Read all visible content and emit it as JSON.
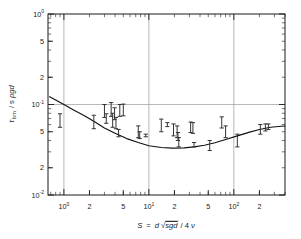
{
  "figure": {
    "background": "#ffffff",
    "ink": "#1a1a1a",
    "grid_color": "#9a9a9a",
    "curve_color": "#111111",
    "marker_color": "#333333"
  },
  "axes": {
    "x": {
      "title_parts": {
        "sym": "S",
        "eq": "=",
        "d": "d",
        "radicand": "sgd",
        "slash": "/ 4",
        "nu": "ν"
      },
      "title_plain": "S = d √sgd / 4 ν",
      "scale": "log",
      "min": 0.65,
      "max": 400,
      "tick_labels": [
        {
          "value": 1,
          "text": "10",
          "sup": "0"
        },
        {
          "value": 2,
          "text": "2",
          "sup": ""
        },
        {
          "value": 5,
          "text": "5",
          "sup": ""
        },
        {
          "value": 10,
          "text": "10",
          "sup": "1"
        },
        {
          "value": 20,
          "text": "2",
          "sup": ""
        },
        {
          "value": 50,
          "text": "5",
          "sup": ""
        },
        {
          "value": 100,
          "text": "10",
          "sup": "2"
        },
        {
          "value": 200,
          "text": "2",
          "sup": ""
        }
      ],
      "gridlines": [
        1,
        10,
        100
      ]
    },
    "y": {
      "title_parts": {
        "tau": "τ",
        "sub": "bm",
        "slash": "/ s",
        "rho": "ρ",
        "gd": "gd"
      },
      "title_plain": "τ bm / s ρgd",
      "scale": "log",
      "min": 0.01,
      "max": 1.0,
      "tick_labels": [
        {
          "value": 1.0,
          "text": "10",
          "sup": "0"
        },
        {
          "value": 0.5,
          "text": "5",
          "sup": ""
        },
        {
          "value": 0.2,
          "text": "2",
          "sup": ""
        },
        {
          "value": 0.1,
          "text": "10",
          "sup": "-1"
        },
        {
          "value": 0.05,
          "text": "5",
          "sup": ""
        },
        {
          "value": 0.02,
          "text": "2",
          "sup": ""
        },
        {
          "value": 0.01,
          "text": "10",
          "sup": "-2"
        }
      ],
      "gridlines": [
        0.1
      ]
    }
  },
  "chart_data": {
    "type": "scatter",
    "title": "",
    "subtitle": "",
    "xlabel": "S = d √sgd / 4 ν",
    "ylabel": "τ bm / s ρgd",
    "xscale": "log",
    "yscale": "log",
    "xlim": [
      0.65,
      400
    ],
    "ylim": [
      0.01,
      1.0
    ],
    "grid": true,
    "legend": "none",
    "series": [
      {
        "name": "measured bed shear stress",
        "type": "errorbar",
        "points": [
          {
            "x": 0.9,
            "y": 0.067,
            "ylow": 0.056,
            "yhigh": 0.079
          },
          {
            "x": 2.25,
            "y": 0.064,
            "ylow": 0.054,
            "yhigh": 0.076
          },
          {
            "x": 3.0,
            "y": 0.085,
            "ylow": 0.072,
            "yhigh": 0.1
          },
          {
            "x": 3.15,
            "y": 0.07,
            "ylow": 0.062,
            "yhigh": 0.079
          },
          {
            "x": 3.6,
            "y": 0.09,
            "ylow": 0.074,
            "yhigh": 0.105
          },
          {
            "x": 3.75,
            "y": 0.066,
            "ylow": 0.056,
            "yhigh": 0.08
          },
          {
            "x": 3.95,
            "y": 0.08,
            "ylow": 0.068,
            "yhigh": 0.092
          },
          {
            "x": 4.1,
            "y": 0.062,
            "ylow": 0.054,
            "yhigh": 0.072
          },
          {
            "x": 4.4,
            "y": 0.048,
            "ylow": 0.044,
            "yhigh": 0.053
          },
          {
            "x": 4.55,
            "y": 0.086,
            "ylow": 0.074,
            "yhigh": 0.1
          },
          {
            "x": 5.0,
            "y": 0.087,
            "ylow": 0.075,
            "yhigh": 0.101
          },
          {
            "x": 7.5,
            "y": 0.05,
            "ylow": 0.043,
            "yhigh": 0.058
          },
          {
            "x": 7.8,
            "y": 0.046,
            "ylow": 0.042,
            "yhigh": 0.05
          },
          {
            "x": 9.2,
            "y": 0.045,
            "ylow": 0.044,
            "yhigh": 0.047
          },
          {
            "x": 14.0,
            "y": 0.059,
            "ylow": 0.05,
            "yhigh": 0.069
          },
          {
            "x": 16.5,
            "y": 0.06,
            "ylow": 0.057,
            "yhigh": 0.063
          },
          {
            "x": 19.5,
            "y": 0.052,
            "ylow": 0.045,
            "yhigh": 0.061
          },
          {
            "x": 21.5,
            "y": 0.05,
            "ylow": 0.043,
            "yhigh": 0.058
          },
          {
            "x": 22.0,
            "y": 0.044,
            "ylow": 0.04,
            "yhigh": 0.049
          },
          {
            "x": 22.5,
            "y": 0.038,
            "ylow": 0.034,
            "yhigh": 0.043
          },
          {
            "x": 31.0,
            "y": 0.056,
            "ylow": 0.049,
            "yhigh": 0.064
          },
          {
            "x": 33.0,
            "y": 0.055,
            "ylow": 0.048,
            "yhigh": 0.063
          },
          {
            "x": 34.0,
            "y": 0.036,
            "ylow": 0.034,
            "yhigh": 0.038
          },
          {
            "x": 52.0,
            "y": 0.035,
            "ylow": 0.031,
            "yhigh": 0.04
          },
          {
            "x": 72.0,
            "y": 0.063,
            "ylow": 0.055,
            "yhigh": 0.073
          },
          {
            "x": 80.0,
            "y": 0.05,
            "ylow": 0.043,
            "yhigh": 0.058
          },
          {
            "x": 110.0,
            "y": 0.04,
            "ylow": 0.034,
            "yhigh": 0.047
          },
          {
            "x": 205.0,
            "y": 0.053,
            "ylow": 0.047,
            "yhigh": 0.06
          },
          {
            "x": 235.0,
            "y": 0.056,
            "ylow": 0.051,
            "yhigh": 0.061
          },
          {
            "x": 255.0,
            "y": 0.057,
            "ylow": 0.053,
            "yhigh": 0.061
          }
        ]
      },
      {
        "name": "theoretical curve",
        "type": "line",
        "x": [
          0.68,
          0.8,
          1.0,
          1.3,
          1.7,
          2.2,
          3.0,
          4.0,
          5.5,
          7.5,
          10.0,
          14.0,
          19.0,
          26.0,
          34.0,
          45.0,
          60.0,
          80.0,
          110.0,
          150.0,
          200.0,
          270.0,
          360.0,
          400.0
        ],
        "y": [
          0.122,
          0.112,
          0.1,
          0.087,
          0.076,
          0.066,
          0.055,
          0.048,
          0.042,
          0.038,
          0.035,
          0.0335,
          0.033,
          0.0332,
          0.034,
          0.0355,
          0.0378,
          0.041,
          0.045,
          0.0492,
          0.053,
          0.056,
          0.0575,
          0.0578
        ]
      }
    ]
  }
}
